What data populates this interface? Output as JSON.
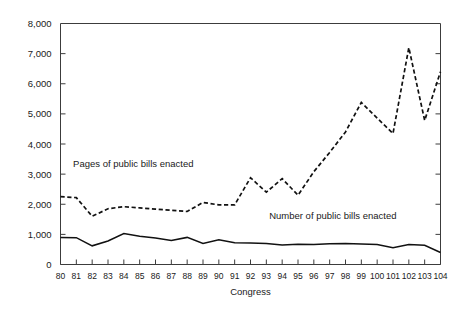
{
  "chart_data": {
    "type": "line",
    "title": "",
    "xlabel": "Congress",
    "ylabel": "",
    "xlim": [
      80,
      104
    ],
    "ylim": [
      0,
      8000
    ],
    "grid": false,
    "legend_position": "inline-annotation",
    "categories": [
      "80",
      "81",
      "82",
      "83",
      "84",
      "85",
      "86",
      "87",
      "88",
      "89",
      "90",
      "91",
      "92",
      "93",
      "94",
      "95",
      "96",
      "97",
      "98",
      "99",
      "100",
      "101",
      "102",
      "103",
      "104"
    ],
    "ytick_labels": [
      "0",
      "1,000",
      "2,000",
      "3,000",
      "4,000",
      "5,000",
      "6,000",
      "7,000",
      "8,000"
    ],
    "ytick_values": [
      0,
      1000,
      2000,
      3000,
      4000,
      5000,
      6000,
      7000,
      8000
    ],
    "series": [
      {
        "name": "Pages of public bills enacted",
        "style": "dashed",
        "color": "#111111",
        "values": [
          2250,
          2220,
          1600,
          1850,
          1920,
          1880,
          1840,
          1800,
          1760,
          2060,
          1980,
          1980,
          2880,
          2400,
          2850,
          2300,
          3080,
          3720,
          4400,
          5380,
          4860,
          4350,
          7200,
          4780,
          6400
        ]
      },
      {
        "name": "Number of public bills enacted",
        "style": "solid",
        "color": "#111111",
        "values": [
          900,
          890,
          620,
          780,
          1030,
          940,
          880,
          800,
          900,
          700,
          820,
          720,
          710,
          700,
          650,
          670,
          660,
          690,
          700,
          680,
          660,
          560,
          660,
          640,
          400
        ]
      }
    ],
    "annotations": [
      {
        "text": "Pages of public bills enacted",
        "x": 84.6,
        "y": 3250
      },
      {
        "text": "Number of public bills enacted",
        "x": 97.2,
        "y": 1520
      }
    ]
  }
}
